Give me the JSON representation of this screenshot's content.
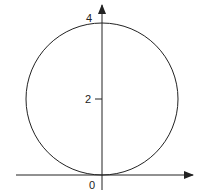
{
  "diagram": {
    "type": "circle-on-axes",
    "circle": {
      "center": [
        0,
        2
      ],
      "radius": 2
    },
    "y_ticks": [
      {
        "value": 2,
        "label": "2"
      },
      {
        "value": 4,
        "label": "4"
      }
    ],
    "origin_label": "0",
    "stroke_color": "#222222"
  }
}
